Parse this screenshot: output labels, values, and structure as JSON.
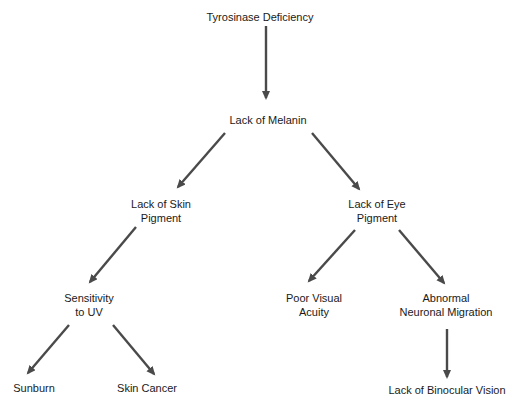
{
  "diagram": {
    "type": "flowchart",
    "arrow_color": "#4a4a4a",
    "nodes": [
      {
        "id": "tyrosinase",
        "label": "Tyrosinase Deficiency",
        "x": 260,
        "y": 10
      },
      {
        "id": "melanin",
        "label": "Lack of Melanin",
        "x": 268,
        "y": 113
      },
      {
        "id": "skin_pigment",
        "label": "Lack of Skin\nPigment",
        "x": 161,
        "y": 197
      },
      {
        "id": "eye_pigment",
        "label": "Lack of Eye\nPigment",
        "x": 377,
        "y": 197
      },
      {
        "id": "uv",
        "label": "Sensitivity\nto UV",
        "x": 89,
        "y": 291
      },
      {
        "id": "visual_acuity",
        "label": "Poor Visual\nAcuity",
        "x": 314,
        "y": 291
      },
      {
        "id": "neuronal",
        "label": "Abnormal\nNeuronal Migration",
        "x": 446,
        "y": 291
      },
      {
        "id": "sunburn",
        "label": "Sunburn",
        "x": 34,
        "y": 381
      },
      {
        "id": "skin_cancer",
        "label": "Skin Cancer",
        "x": 147,
        "y": 381
      },
      {
        "id": "binocular",
        "label": "Lack of Binocular Vision",
        "x": 447,
        "y": 383
      }
    ],
    "edges": [
      {
        "from": "tyrosinase",
        "to": "melanin",
        "x1": 266,
        "y1": 26,
        "x2": 266,
        "y2": 98
      },
      {
        "from": "melanin",
        "to": "skin_pigment",
        "x1": 225,
        "y1": 133,
        "x2": 178,
        "y2": 187
      },
      {
        "from": "melanin",
        "to": "eye_pigment",
        "x1": 312,
        "y1": 133,
        "x2": 359,
        "y2": 189
      },
      {
        "from": "skin_pigment",
        "to": "uv",
        "x1": 136,
        "y1": 227,
        "x2": 90,
        "y2": 282
      },
      {
        "from": "eye_pigment",
        "to": "visual_acuity",
        "x1": 355,
        "y1": 230,
        "x2": 309,
        "y2": 281
      },
      {
        "from": "eye_pigment",
        "to": "neuronal",
        "x1": 399,
        "y1": 230,
        "x2": 444,
        "y2": 283
      },
      {
        "from": "uv",
        "to": "sunburn",
        "x1": 69,
        "y1": 325,
        "x2": 28,
        "y2": 373
      },
      {
        "from": "uv",
        "to": "skin_cancer",
        "x1": 113,
        "y1": 325,
        "x2": 154,
        "y2": 374
      },
      {
        "from": "neuronal",
        "to": "binocular",
        "x1": 447,
        "y1": 329,
        "x2": 447,
        "y2": 377
      }
    ]
  }
}
